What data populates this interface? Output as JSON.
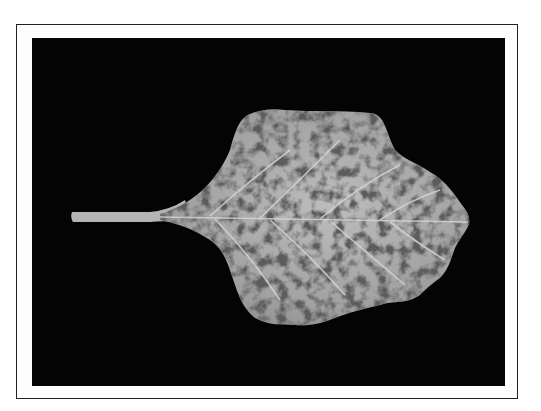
{
  "figure": {
    "background_color": "#040404",
    "frame_color": "#222222",
    "leaf_base_color": "#8a8a8a",
    "leaf_highlight_color": "#c8c8c8",
    "leaf_spot_color": "#666666"
  }
}
